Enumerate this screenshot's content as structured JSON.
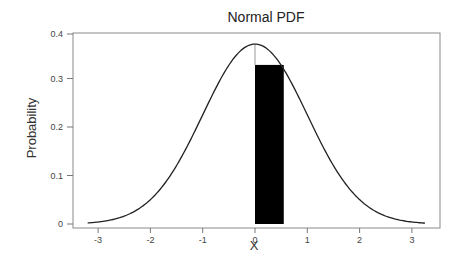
{
  "chart_data": {
    "type": "line",
    "title": "Normal PDF",
    "xlabel": "X",
    "ylabel": "Probability",
    "xlim": [
      -3.5,
      3.55
    ],
    "ylim": [
      -0.008,
      0.4
    ],
    "x_ticks": [
      -3,
      -2,
      -1,
      0,
      1,
      2,
      3
    ],
    "y_ticks": [
      0,
      0.1,
      0.2,
      0.3,
      0.4
    ],
    "x_tick_labels": [
      "-3",
      "-2",
      "-1",
      "0",
      "1",
      "2",
      "3"
    ],
    "y_tick_labels": [
      "0",
      "0.1",
      "0.2",
      "0.3",
      "0.4"
    ],
    "grid": false,
    "legend": null,
    "series": [
      {
        "name": "Normal PDF curve",
        "type": "line",
        "color": "#222222",
        "x": [
          -3.2,
          -3.0,
          -2.5,
          -2.0,
          -1.5,
          -1.0,
          -0.5,
          0.0,
          0.5,
          1.0,
          1.5,
          2.0,
          2.5,
          3.0,
          3.25
        ],
        "y": [
          0.002,
          0.004,
          0.016,
          0.05,
          0.12,
          0.225,
          0.328,
          0.371,
          0.328,
          0.225,
          0.12,
          0.05,
          0.016,
          0.004,
          0.002
        ]
      },
      {
        "name": "Highlighted interval",
        "type": "bar",
        "color": "#000000",
        "x_start": 0.0,
        "x_end": 0.55,
        "height": 0.328
      }
    ],
    "annotations": [
      {
        "type": "vertical-line",
        "x": 0.0,
        "from": 0.328,
        "to": 0.371,
        "color": "#999999"
      }
    ]
  }
}
